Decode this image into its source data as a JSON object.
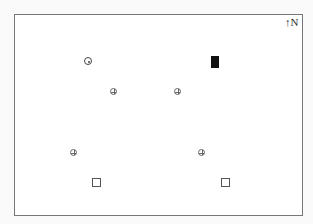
{
  "compass": {
    "label": "↑N"
  },
  "markers": [
    {
      "type": "circle-dot",
      "x": 84,
      "y": 57
    },
    {
      "type": "filled-rect",
      "x": 211,
      "y": 56,
      "w": 8,
      "h": 12
    },
    {
      "type": "circle-plus",
      "x": 110,
      "y": 88
    },
    {
      "type": "circle-plus",
      "x": 174,
      "y": 88
    },
    {
      "type": "circle-plus",
      "x": 70,
      "y": 149
    },
    {
      "type": "circle-plus",
      "x": 198,
      "y": 149
    },
    {
      "type": "square",
      "x": 92,
      "y": 178
    },
    {
      "type": "square",
      "x": 221,
      "y": 178
    }
  ]
}
